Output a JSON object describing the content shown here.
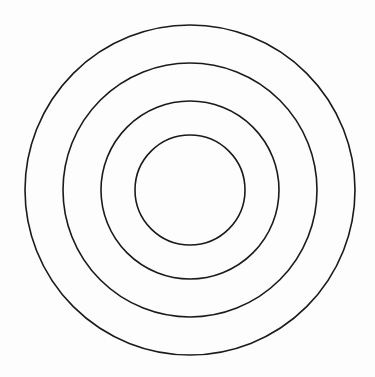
{
  "diagram": {
    "type": "concentric-circles",
    "center": {
      "x": 190,
      "y": 190
    },
    "stroke_color": "#1a1a1a",
    "stroke_width": 1.6,
    "background": "#fdfdfd",
    "circles": [
      {
        "id": "ring-1-outermost",
        "r": 165
      },
      {
        "id": "ring-2",
        "r": 127
      },
      {
        "id": "ring-3",
        "r": 89
      },
      {
        "id": "ring-4-innermost",
        "r": 55
      }
    ]
  }
}
